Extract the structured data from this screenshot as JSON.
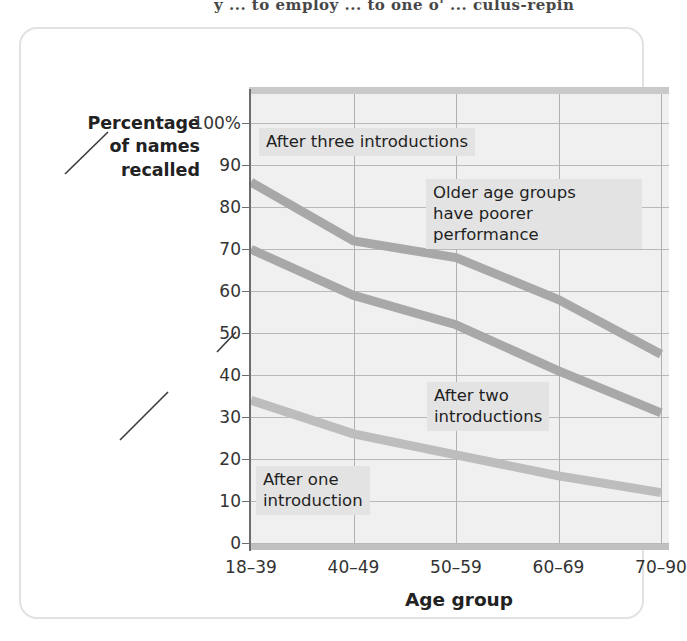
{
  "page_top_text": "y ... to employ ... to one o' ... culus-repin",
  "figure": {
    "y_axis_title": "Percentage\nof names\nrecalled",
    "x_axis_title": "Age group"
  },
  "chart_data": {
    "type": "line",
    "title": "",
    "xlabel": "Age group",
    "ylabel": "Percentage of names recalled",
    "categories": [
      "18–39",
      "40–49",
      "50–59",
      "60–69",
      "70–90"
    ],
    "ytick_labels": [
      "100%",
      "90",
      "80",
      "70",
      "60",
      "50",
      "40",
      "30",
      "20",
      "10",
      "0"
    ],
    "yticks": [
      100,
      90,
      80,
      70,
      60,
      50,
      40,
      30,
      20,
      10,
      0
    ],
    "ylim": [
      0,
      107
    ],
    "grid": true,
    "legend": "none",
    "series": [
      {
        "name": "After three introductions",
        "values": [
          86,
          72,
          68,
          58,
          45
        ],
        "color": "#a8a8a8"
      },
      {
        "name": "After two introductions",
        "values": [
          70,
          59,
          52,
          41,
          31
        ],
        "color": "#a8a8a8"
      },
      {
        "name": "After one introduction",
        "values": [
          34,
          26,
          21,
          16,
          12
        ],
        "color": "#bdbdbd"
      }
    ],
    "annotations": [
      {
        "name": "after-three-introductions",
        "text": "After three introductions"
      },
      {
        "name": "older-age-groups",
        "text": "Older age groups\nhave poorer performance"
      },
      {
        "name": "after-two-introductions",
        "text": "After two\nintroductions"
      },
      {
        "name": "after-one-introduction",
        "text": "After one\nintroduction"
      }
    ]
  },
  "colors": {
    "plot_background": "#f0f0f0",
    "gridline": "#b9b9b9",
    "axis": "#6d6d6d",
    "line": "#a8a8a8",
    "annotation_background": "#e3e3e3",
    "card_border": "#e2e2e2"
  }
}
